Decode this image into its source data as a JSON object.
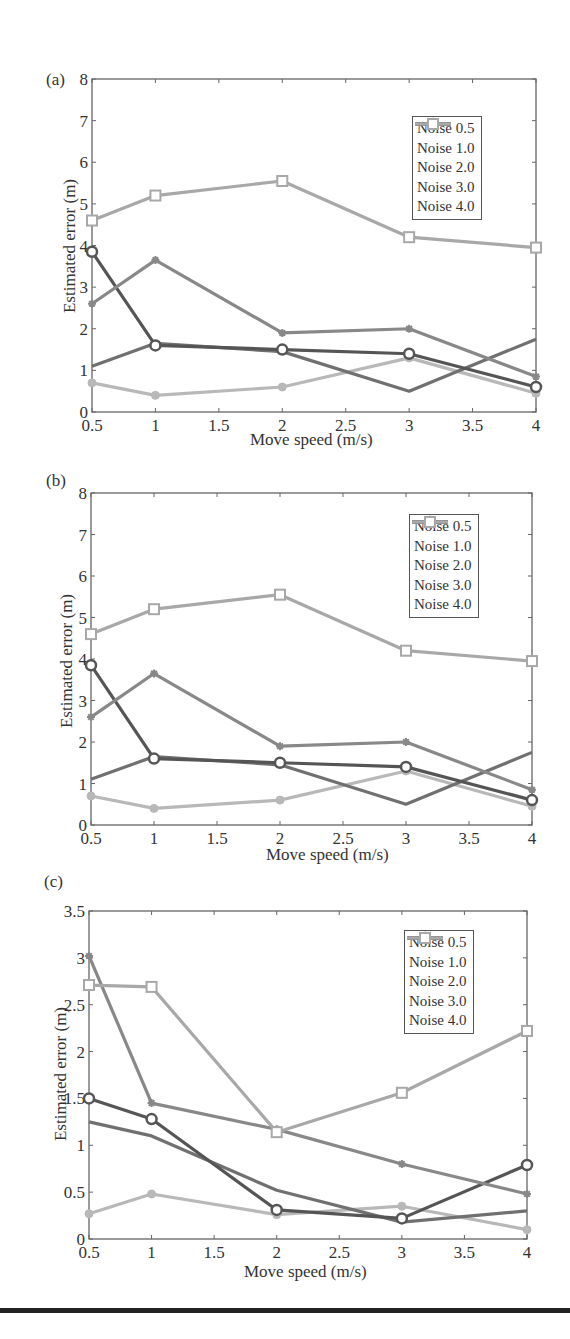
{
  "chart_data": [
    {
      "type": "line",
      "panel_label": "(a)",
      "title": "",
      "xlabel": "Move speed (m/s)",
      "ylabel": "Estimated error (m)",
      "x": [
        0.5,
        1,
        2,
        3,
        4
      ],
      "xlim": [
        0.5,
        4
      ],
      "ylim": [
        0,
        8
      ],
      "xticks": [
        "0.5",
        "1",
        "1.5",
        "2",
        "2.5",
        "3",
        "3.5",
        "4"
      ],
      "yticks": [
        "0",
        "1",
        "2",
        "3",
        "4",
        "5",
        "6",
        "7",
        "8"
      ],
      "grid": false,
      "legend_position": "upper right",
      "series": [
        {
          "name": "Noise 0.5",
          "values": [
            0.7,
            0.4,
            0.6,
            1.3,
            0.45
          ],
          "color": "#b8b8b8",
          "marker": "diamond"
        },
        {
          "name": "Noise 1.0",
          "values": [
            1.1,
            1.65,
            1.45,
            0.5,
            1.75
          ],
          "color": "#707070",
          "marker": "none"
        },
        {
          "name": "Noise 2.0",
          "values": [
            3.85,
            1.6,
            1.5,
            1.4,
            0.6
          ],
          "color": "#555555",
          "marker": "circle"
        },
        {
          "name": "Noise 3.0",
          "values": [
            2.6,
            3.65,
            1.9,
            2.0,
            0.85
          ],
          "color": "#888888",
          "marker": "star"
        },
        {
          "name": "Noise 4.0",
          "values": [
            4.6,
            5.2,
            5.55,
            4.2,
            3.95
          ],
          "color": "#a8a8a8",
          "marker": "square"
        }
      ]
    },
    {
      "type": "line",
      "panel_label": "(b)",
      "title": "",
      "xlabel": "Move speed (m/s)",
      "ylabel": "Estimated error (m)",
      "x": [
        0.5,
        1,
        2,
        3,
        4
      ],
      "xlim": [
        0.5,
        4
      ],
      "ylim": [
        0,
        8
      ],
      "xticks": [
        "0.5",
        "1",
        "1.5",
        "2",
        "2.5",
        "3",
        "3.5",
        "4"
      ],
      "yticks": [
        "0",
        "1",
        "2",
        "3",
        "4",
        "5",
        "6",
        "7",
        "8"
      ],
      "grid": false,
      "legend_position": "upper right",
      "series": [
        {
          "name": "Noise 0.5",
          "values": [
            0.7,
            0.4,
            0.6,
            1.3,
            0.45
          ],
          "color": "#b8b8b8",
          "marker": "diamond"
        },
        {
          "name": "Noise 1.0",
          "values": [
            1.1,
            1.65,
            1.45,
            0.5,
            1.75
          ],
          "color": "#707070",
          "marker": "none"
        },
        {
          "name": "Noise 2.0",
          "values": [
            3.85,
            1.6,
            1.5,
            1.4,
            0.6
          ],
          "color": "#555555",
          "marker": "circle"
        },
        {
          "name": "Noise 3.0",
          "values": [
            2.6,
            3.65,
            1.9,
            2.0,
            0.85
          ],
          "color": "#888888",
          "marker": "star"
        },
        {
          "name": "Noise 4.0",
          "values": [
            4.6,
            5.2,
            5.55,
            4.2,
            3.95
          ],
          "color": "#a8a8a8",
          "marker": "square"
        }
      ]
    },
    {
      "type": "line",
      "panel_label": "(c)",
      "title": "",
      "xlabel": "Move speed (m/s)",
      "ylabel": "Estimated error (m)",
      "x": [
        0.5,
        1,
        2,
        3,
        4
      ],
      "xlim": [
        0.5,
        4
      ],
      "ylim": [
        0,
        3.5
      ],
      "xticks": [
        "0.5",
        "1",
        "1.5",
        "2",
        "2.5",
        "3",
        "3.5",
        "4"
      ],
      "yticks": [
        "0",
        "0.5",
        "1",
        "1.5",
        "2",
        "2.5",
        "3",
        "3.5"
      ],
      "grid": false,
      "legend_position": "upper right",
      "series": [
        {
          "name": "Noise 0.5",
          "values": [
            0.27,
            0.48,
            0.26,
            0.35,
            0.1
          ],
          "color": "#b8b8b8",
          "marker": "diamond"
        },
        {
          "name": "Noise 1.0",
          "values": [
            1.25,
            1.1,
            0.52,
            0.18,
            0.3
          ],
          "color": "#707070",
          "marker": "none"
        },
        {
          "name": "Noise 2.0",
          "values": [
            1.5,
            1.28,
            0.31,
            0.22,
            0.79
          ],
          "color": "#555555",
          "marker": "circle"
        },
        {
          "name": "Noise 3.0",
          "values": [
            3.02,
            1.45,
            1.17,
            0.8,
            0.48
          ],
          "color": "#888888",
          "marker": "star"
        },
        {
          "name": "Noise 4.0",
          "values": [
            2.71,
            2.69,
            1.14,
            1.56,
            2.22
          ],
          "color": "#a8a8a8",
          "marker": "square"
        }
      ]
    }
  ]
}
